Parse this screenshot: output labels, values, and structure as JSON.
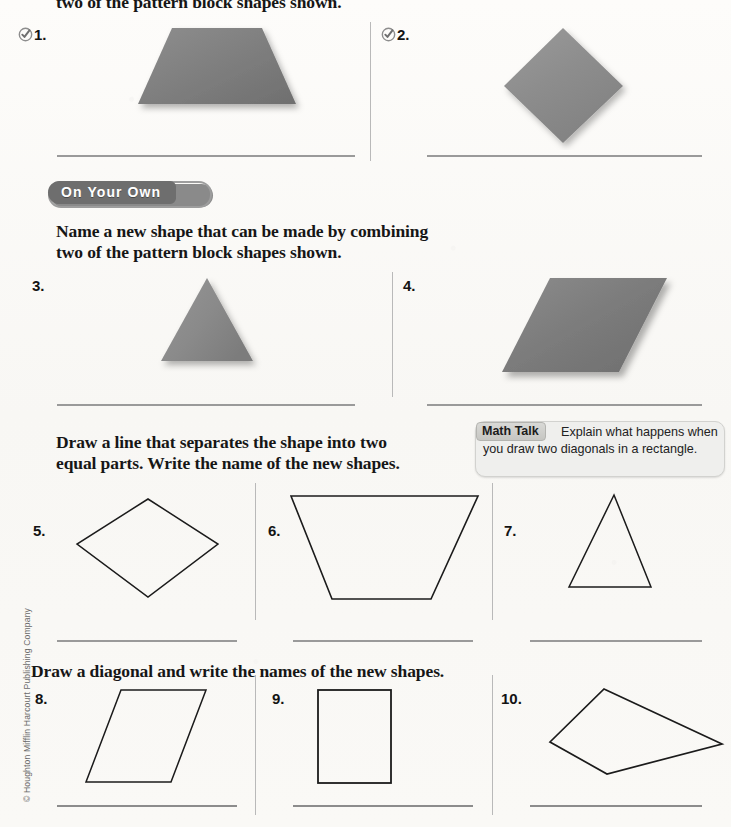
{
  "page": {
    "top_cut_instruction": "two of the pattern block shapes shown.",
    "copyright": "© Houghton Mifflin Harcourt Publishing Company"
  },
  "section_share_show": {
    "problems": [
      {
        "number": "1.",
        "icon": "check-circle-icon",
        "shape": "trapezoid",
        "shape_color": "#7d7d7d"
      },
      {
        "number": "2.",
        "icon": "check-circle-icon",
        "shape": "rhombus-square",
        "shape_color": "#8f8f8f"
      }
    ]
  },
  "section_on_your_own": {
    "banner_label": "On Your Own",
    "instruction_line1": "Name a new shape that can be made by combining",
    "instruction_line2": "two of the pattern block shapes shown.",
    "problems": [
      {
        "number": "3.",
        "shape": "triangle",
        "shape_color": "#8a8a8a"
      },
      {
        "number": "4.",
        "shape": "parallelogram",
        "shape_color": "#757575"
      }
    ]
  },
  "section_separate": {
    "instruction_line1": "Draw a line that separates the shape into two",
    "instruction_line2": "equal parts. Write the name of the new shapes.",
    "math_talk": {
      "label": "Math Talk",
      "text": "Explain what happens when you draw two diagonals in a rectangle."
    },
    "problems": [
      {
        "number": "5.",
        "shape": "rhombus-outline"
      },
      {
        "number": "6.",
        "shape": "trapezoid-outline"
      },
      {
        "number": "7.",
        "shape": "triangle-outline"
      }
    ]
  },
  "section_diagonal": {
    "instruction": "Draw a diagonal and write the names of the new shapes.",
    "problems": [
      {
        "number": "8.",
        "shape": "parallelogram-outline"
      },
      {
        "number": "9.",
        "shape": "square-outline"
      },
      {
        "number": "10.",
        "shape": "kite-outline"
      }
    ]
  },
  "colors": {
    "answer_line": "#9a9a9a",
    "divider": "#b9b9b9",
    "banner_fill": "#6e6e6e",
    "math_talk_bg": "#efefed",
    "ink": "#161616"
  }
}
